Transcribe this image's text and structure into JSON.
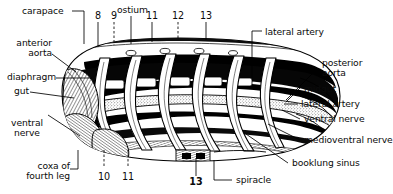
{
  "figure": {
    "style": "black-and-white engraved anatomical illustration",
    "ink_color": "#000000",
    "paper_color": "#ffffff"
  },
  "labels": {
    "carapace": "carapace",
    "ostium": "ostium",
    "anterior_aorta": "anterior\naorta",
    "diaphragm": "diaphragm",
    "gut": "gut",
    "ventral_nerve_left": "ventral\nnerve",
    "coxa_of_fourth_leg": "coxa of\nfourth leg",
    "lateral_artery_top": "lateral artery",
    "posterior_aorta": "posterior\naorta",
    "midgut": "midgut",
    "lateral_artery_right": "lateral artery",
    "ventral_nerve_right": "ventral nerve",
    "medioventral_nerve": "medioventral nerve",
    "booklung_sinus": "booklung sinus",
    "spiracle": "spiracle"
  },
  "numbers": {
    "top": [
      "8",
      "9",
      "11",
      "12",
      "13"
    ],
    "bottom": [
      "10",
      "11",
      "13"
    ]
  }
}
